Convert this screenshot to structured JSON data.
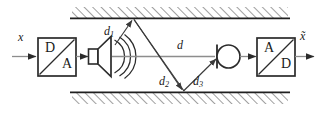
{
  "figure": {
    "background": "#ffffff",
    "signal_line_color": "#8d8d8d",
    "diagram_line_color": "#3a3a3a",
    "wall_line_color": "#1f1f1f",
    "text_color": "#1a1a1a"
  },
  "signals": {
    "input_label": "x",
    "output_label": "x̃"
  },
  "blocks": {
    "dac": {
      "name": "D/A converter",
      "top_char": "D",
      "bottom_char": "A"
    },
    "adc": {
      "name": "A/D converter",
      "top_char": "A",
      "bottom_char": "D"
    },
    "loudspeaker": {
      "name": "loudspeaker",
      "wave_arcs": 3
    },
    "microphone": {
      "name": "microphone"
    }
  },
  "room": {
    "ceiling": {
      "label": "hatched ceiling",
      "hatch_direction": "up-right"
    },
    "floor": {
      "label": "hatched floor",
      "hatch_direction": "up-right"
    }
  },
  "paths": [
    {
      "id": "d1",
      "label": "d",
      "sub": "1",
      "desc": "ceiling reflection incident path"
    },
    {
      "id": "d",
      "label": "d",
      "sub": "",
      "desc": "direct path loudspeaker to microphone"
    },
    {
      "id": "d2",
      "label": "d",
      "sub": "2",
      "desc": "floor reflection incident path"
    },
    {
      "id": "d3",
      "label": "d",
      "sub": "3",
      "desc": "floor reflection reflected path"
    }
  ]
}
